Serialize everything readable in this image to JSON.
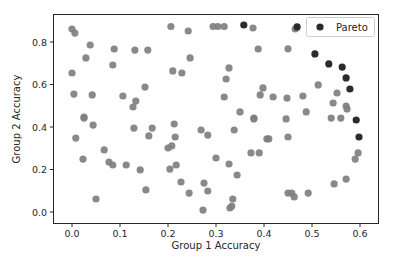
{
  "chart_data": {
    "type": "scatter",
    "title": "",
    "xlabel": "Group 1 Accuracy",
    "ylabel": "Group 2 Accuracy",
    "xlim": [
      -0.04,
      0.637
    ],
    "ylim": [
      -0.05,
      0.935
    ],
    "xticks": [
      0.0,
      0.1,
      0.2,
      0.3,
      0.4,
      0.5,
      0.6
    ],
    "xtick_labels": [
      "0.0",
      "0.1",
      "0.2",
      "0.3",
      "0.4",
      "0.5",
      "0.6"
    ],
    "yticks": [
      0.0,
      0.2,
      0.4,
      0.6,
      0.8
    ],
    "ytick_labels": [
      "0.0",
      "0.2",
      "0.4",
      "0.6",
      "0.8"
    ],
    "grid": false,
    "legend": {
      "position": "upper right",
      "entries": [
        "Pareto"
      ]
    },
    "series": [
      {
        "name": "All models",
        "color": "#7f7f7f",
        "in_legend": false,
        "points": [
          [
            0.0,
            0.861
          ],
          [
            0.006,
            0.842
          ],
          [
            0.038,
            0.786
          ],
          [
            0.088,
            0.767
          ],
          [
            0.131,
            0.762
          ],
          [
            0.158,
            0.762
          ],
          [
            0.029,
            0.725
          ],
          [
            0.085,
            0.692
          ],
          [
            0.0,
            0.654
          ],
          [
            0.004,
            0.555
          ],
          [
            0.042,
            0.551
          ],
          [
            0.152,
            0.588
          ],
          [
            0.106,
            0.546
          ],
          [
            0.133,
            0.522
          ],
          [
            0.127,
            0.494
          ],
          [
            0.025,
            0.447
          ],
          [
            0.206,
            0.873
          ],
          [
            0.242,
            0.852
          ],
          [
            0.294,
            0.873
          ],
          [
            0.304,
            0.873
          ],
          [
            0.317,
            0.873
          ],
          [
            0.377,
            0.866
          ],
          [
            0.388,
            0.767
          ],
          [
            0.246,
            0.725
          ],
          [
            0.21,
            0.664
          ],
          [
            0.229,
            0.654
          ],
          [
            0.327,
            0.678
          ],
          [
            0.321,
            0.626
          ],
          [
            0.398,
            0.584
          ],
          [
            0.392,
            0.551
          ],
          [
            0.317,
            0.541
          ],
          [
            0.35,
            0.471
          ],
          [
            0.379,
            0.442
          ],
          [
            0.465,
            0.861
          ],
          [
            0.45,
            0.768
          ],
          [
            0.513,
            0.598
          ],
          [
            0.552,
            0.56
          ],
          [
            0.544,
            0.513
          ],
          [
            0.573,
            0.485
          ],
          [
            0.419,
            0.541
          ],
          [
            0.448,
            0.536
          ],
          [
            0.481,
            0.546
          ],
          [
            0.488,
            0.471
          ],
          [
            0.571,
            0.499
          ],
          [
            0.446,
            0.438
          ],
          [
            0.54,
            0.442
          ],
          [
            0.56,
            0.442
          ],
          [
            0.41,
            0.344
          ],
          [
            0.45,
            0.353
          ],
          [
            0.596,
            0.278
          ],
          [
            0.59,
            0.249
          ],
          [
            0.571,
            0.155
          ],
          [
            0.546,
            0.132
          ],
          [
            0.45,
            0.089
          ],
          [
            0.458,
            0.089
          ],
          [
            0.463,
            0.071
          ],
          [
            0.492,
            0.089
          ],
          [
            0.025,
            0.442
          ],
          [
            0.044,
            0.409
          ],
          [
            0.129,
            0.395
          ],
          [
            0.167,
            0.395
          ],
          [
            0.16,
            0.358
          ],
          [
            0.008,
            0.348
          ],
          [
            0.067,
            0.292
          ],
          [
            0.023,
            0.249
          ],
          [
            0.077,
            0.235
          ],
          [
            0.085,
            0.221
          ],
          [
            0.113,
            0.221
          ],
          [
            0.142,
            0.198
          ],
          [
            0.154,
            0.104
          ],
          [
            0.05,
            0.061
          ],
          [
            0.213,
            0.414
          ],
          [
            0.269,
            0.386
          ],
          [
            0.283,
            0.362
          ],
          [
            0.338,
            0.386
          ],
          [
            0.379,
            0.438
          ],
          [
            0.406,
            0.344
          ],
          [
            0.215,
            0.353
          ],
          [
            0.2,
            0.301
          ],
          [
            0.208,
            0.311
          ],
          [
            0.3,
            0.254
          ],
          [
            0.327,
            0.226
          ],
          [
            0.39,
            0.278
          ],
          [
            0.373,
            0.278
          ],
          [
            0.217,
            0.221
          ],
          [
            0.204,
            0.202
          ],
          [
            0.344,
            0.174
          ],
          [
            0.227,
            0.141
          ],
          [
            0.275,
            0.136
          ],
          [
            0.283,
            0.099
          ],
          [
            0.244,
            0.089
          ],
          [
            0.335,
            0.061
          ],
          [
            0.333,
            0.028
          ],
          [
            0.329,
            0.019
          ],
          [
            0.273,
            0.009
          ]
        ]
      },
      {
        "name": "Pareto",
        "color": "#2b2b2b",
        "in_legend": true,
        "points": [
          [
            0.358,
            0.88
          ],
          [
            0.469,
            0.871
          ],
          [
            0.506,
            0.744
          ],
          [
            0.535,
            0.697
          ],
          [
            0.563,
            0.682
          ],
          [
            0.571,
            0.631
          ],
          [
            0.579,
            0.579
          ],
          [
            0.592,
            0.433
          ],
          [
            0.598,
            0.353
          ]
        ]
      }
    ]
  }
}
